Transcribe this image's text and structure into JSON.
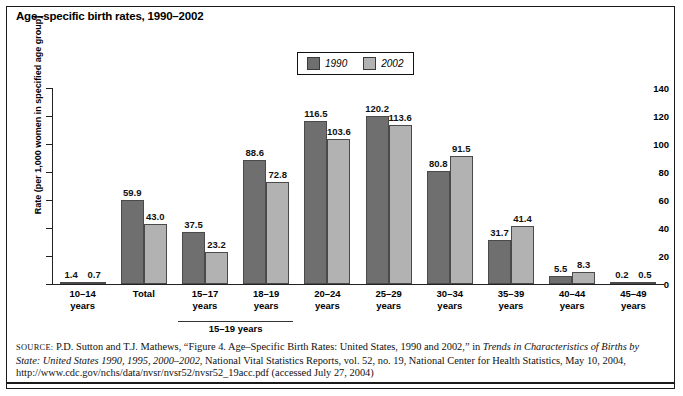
{
  "title": "Age–specific birth rates, 1990–2002",
  "legend": {
    "position": "top-center",
    "entries": [
      {
        "label": "1990",
        "color": "#6f6f6f"
      },
      {
        "label": "2002",
        "color": "#b2b2b2"
      }
    ]
  },
  "axis": {
    "ylabel": "Rate (per 1,000 women in specified age group)",
    "yticks": [
      "0",
      "20",
      "40",
      "60",
      "80",
      "100",
      "120",
      "140"
    ]
  },
  "bracket": {
    "label": "15–19 years"
  },
  "source": {
    "prefix": "SOURCE:",
    "line1_a": " P.D. Sutton and T.J. Mathews, “Figure 4. Age–Specific Birth Rates: United States, 1990 and 2002,” in ",
    "line1_i": "Trends in Characteristics of Births by",
    "line2_i": "State: United States 1990, 1995, 2000–2002,",
    "line2_a": " National Vital Statistics Reports, vol. 52, no. 19, National Center for Health Statistics, May 10, 2004, http://",
    "line3_a": "www.cdc.gov/nchs/data/nvsr/nvsr52/nvsr52_19acc.pdf (accessed July 27, 2004)"
  },
  "chart_data": {
    "type": "bar",
    "title": "Age–specific birth rates, 1990–2002",
    "xlabel": "",
    "ylabel": "Rate (per 1,000 women in specified age group)",
    "ylim": [
      0,
      140
    ],
    "ytick_step": 20,
    "grid": false,
    "legend_position": "top-center",
    "categories": [
      "10–14 years",
      "Total",
      "15–17 years",
      "18–19 years",
      "20–24 years",
      "25–29 years",
      "30–34 years",
      "35–39 years",
      "40–44 years",
      "45–49 years"
    ],
    "category_lines": [
      [
        "10–14",
        "years"
      ],
      [
        "Total",
        ""
      ],
      [
        "15–17",
        "years"
      ],
      [
        "18–19",
        "years"
      ],
      [
        "20–24",
        "years"
      ],
      [
        "25–29",
        "years"
      ],
      [
        "30–34",
        "years"
      ],
      [
        "35–39",
        "years"
      ],
      [
        "40–44",
        "years"
      ],
      [
        "45–49",
        "years"
      ]
    ],
    "series": [
      {
        "name": "1990",
        "color": "#6f6f6f",
        "values": [
          1.4,
          59.9,
          37.5,
          88.6,
          116.5,
          120.2,
          80.8,
          31.7,
          5.5,
          0.2
        ]
      },
      {
        "name": "2002",
        "color": "#b2b2b2",
        "values": [
          0.7,
          43.0,
          23.2,
          72.8,
          103.6,
          113.6,
          91.5,
          41.4,
          8.3,
          0.5
        ]
      }
    ],
    "value_labels": {
      "1990": [
        "1.4",
        "59.9",
        "37.5",
        "88.6",
        "116.5",
        "120.2",
        "80.8",
        "31.7",
        "5.5",
        "0.2"
      ],
      "2002": [
        "0.7",
        "43.0",
        "23.2",
        "72.8",
        "103.6",
        "113.6",
        "91.5",
        "41.4",
        "8.3",
        "0.5"
      ]
    },
    "bracket_group": {
      "label": "15–19 years",
      "covers": [
        "15–17 years",
        "18–19 years"
      ]
    }
  }
}
